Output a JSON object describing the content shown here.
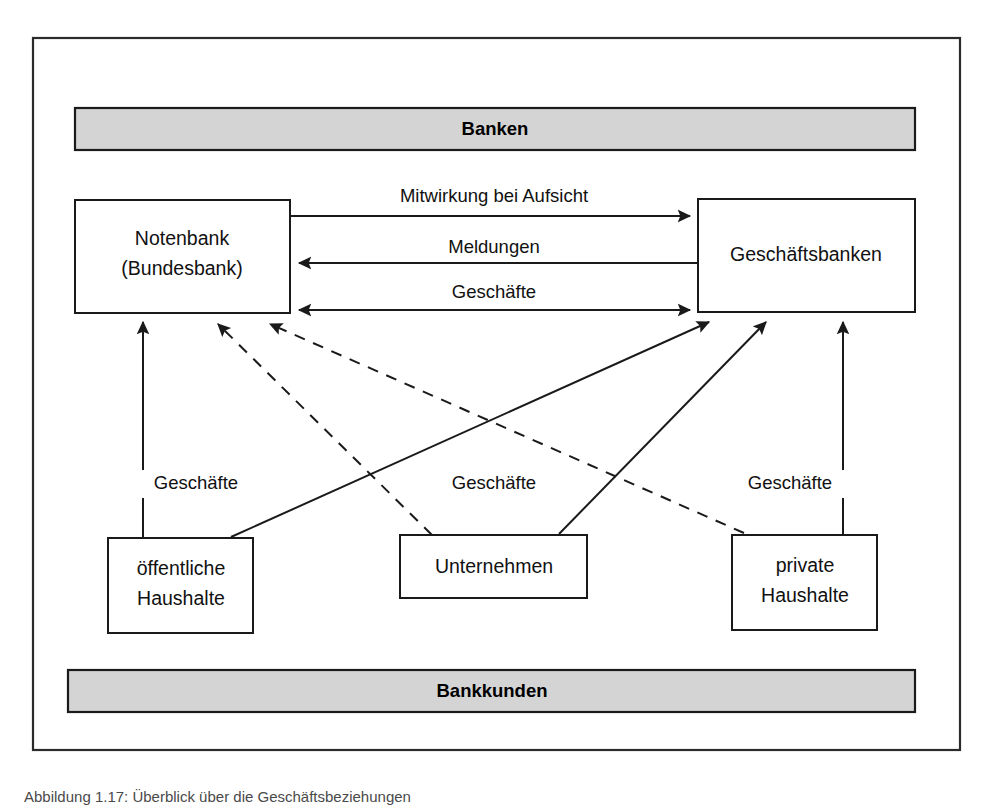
{
  "figure": {
    "caption": "Abbildung 1.17: Überblick über die Geschäftsbeziehungen",
    "frame": {
      "x": 33,
      "y": 38,
      "width": 927,
      "height": 712
    },
    "colors": {
      "band_fill": "#d4d4d4",
      "stroke": "#1a1a1a",
      "background": "#ffffff"
    }
  },
  "bands": [
    {
      "id": "banken",
      "label": "Banken",
      "x": 75,
      "y": 108,
      "width": 840,
      "height": 42
    },
    {
      "id": "bankkunden",
      "label": "Bankkunden",
      "x": 68,
      "y": 670,
      "width": 847,
      "height": 42
    }
  ],
  "nodes": [
    {
      "id": "notenbank",
      "lines": [
        "Notenbank",
        "(Bundesbank)"
      ],
      "x": 75,
      "y": 200,
      "width": 215,
      "height": 113
    },
    {
      "id": "geschaeftsbanken",
      "lines": [
        "Geschäftsbanken"
      ],
      "x": 698,
      "y": 199,
      "width": 217,
      "height": 113
    },
    {
      "id": "oeffentliche-haushalte",
      "lines": [
        "öffentliche",
        "Haushalte"
      ],
      "x": 108,
      "y": 538,
      "width": 145,
      "height": 95
    },
    {
      "id": "unternehmen",
      "lines": [
        "Unternehmen"
      ],
      "x": 400,
      "y": 535,
      "width": 187,
      "height": 63
    },
    {
      "id": "private-haushalte",
      "lines": [
        "private",
        "Haushalte"
      ],
      "x": 732,
      "y": 535,
      "width": 145,
      "height": 95
    }
  ],
  "edges": [
    {
      "id": "mitwirkung-bei-aufsicht",
      "label": "Mitwirkung bei Aufsicht",
      "from": "notenbank",
      "to": "geschaeftsbanken",
      "style": "solid",
      "direction": "right",
      "label_x": 494,
      "label_y": 197,
      "path": "M 290 216 L 692 216"
    },
    {
      "id": "meldungen",
      "label": "Meldungen",
      "from": "geschaeftsbanken",
      "to": "notenbank",
      "style": "solid",
      "direction": "left",
      "label_x": 494,
      "label_y": 248,
      "path": "M 698 263 L 297 263"
    },
    {
      "id": "geschaefte-interbank",
      "label": "Geschäfte",
      "from": "notenbank",
      "to": "geschaeftsbanken",
      "style": "solid",
      "direction": "both",
      "label_x": 494,
      "label_y": 293,
      "path": "M 297 310 L 692 310"
    },
    {
      "id": "geschaefte-oeffentliche",
      "label": "Geschäfte",
      "from": "oeffentliche-haushalte",
      "to": "notenbank",
      "style": "solid",
      "direction": "up",
      "label_x": 196,
      "label_y": 484,
      "path": "M 143 538 L 143 320"
    },
    {
      "id": "geschaefte-unternehmen-notenbank",
      "label": "",
      "from": "unternehmen",
      "to": "notenbank",
      "style": "dashed",
      "direction": "up",
      "path": "M 430 535 L 216 322"
    },
    {
      "id": "geschaefte-private-notenbank",
      "label": "",
      "from": "private-haushalte",
      "to": "notenbank",
      "style": "dashed",
      "direction": "up",
      "path": "M 742 533 L 268 322"
    },
    {
      "id": "geschaefte-oeffentliche-banken",
      "label": "",
      "from": "oeffentliche-haushalte",
      "to": "geschaeftsbanken",
      "style": "solid",
      "direction": "up",
      "path": "M 232 537 L 711 320"
    },
    {
      "id": "geschaefte-unternehmen-banken",
      "label": "Geschäfte",
      "from": "unternehmen",
      "to": "geschaeftsbanken",
      "style": "solid",
      "direction": "up",
      "label_x": 494,
      "label_y": 484,
      "path": "M 560 534 L 768 320"
    },
    {
      "id": "geschaefte-private-banken",
      "label": "Geschäfte",
      "from": "private-haushalte",
      "to": "geschaeftsbanken",
      "style": "solid",
      "direction": "up",
      "label_x": 790,
      "label_y": 484,
      "path": "M 843 535 L 843 320"
    }
  ]
}
